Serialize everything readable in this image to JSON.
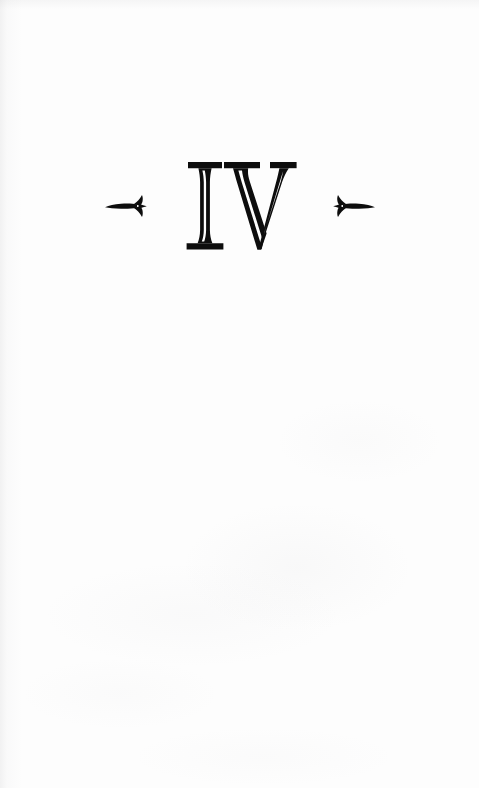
{
  "page": {
    "kind": "book-page",
    "background_color": "#fdfdfd",
    "ink_color": "#0d0d0d",
    "width": 479,
    "height": 788
  },
  "chapter_opener": {
    "numeral": "IV",
    "numeral_arabic": "4",
    "numeral_style": "roman-inline-serif",
    "ornament_left": "arrow-right-ornament",
    "ornament_right": "arrow-left-ornament"
  },
  "body": {
    "text": ""
  }
}
